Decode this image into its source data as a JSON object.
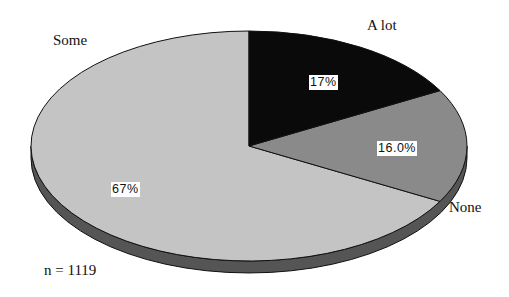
{
  "chart_data": {
    "type": "pie",
    "style": "3d-tilted",
    "categories": [
      "A lot",
      "None",
      "Some"
    ],
    "values": [
      17,
      16.0,
      67
    ],
    "value_labels": [
      "17%",
      "16.0%",
      "67%"
    ],
    "colors": [
      "#0a0a0a",
      "#8a8a8a",
      "#c4c4c4"
    ],
    "side_color": "#555555",
    "title": "",
    "legend": "none",
    "annotations": [
      "n = 1119"
    ]
  },
  "labels": {
    "a_lot": "A lot",
    "none": "None",
    "some": "Some",
    "pct_a_lot": "17%",
    "pct_none": "16.0%",
    "pct_some": "67%",
    "sample_size": "n = 1119"
  }
}
